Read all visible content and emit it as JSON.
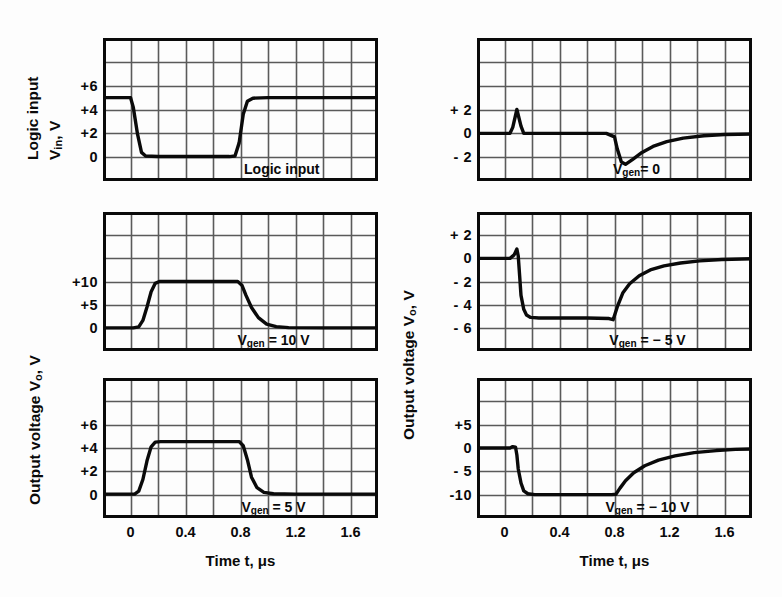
{
  "figure": {
    "background": "#fdfdfd",
    "ink": "#0a0a0a",
    "grid_color": "#5a5a5a"
  },
  "axis_titles": {
    "x_left": "Time t, μs",
    "x_right": "Time t, μs",
    "y_left_top_line1": "Logic input",
    "y_left_top_line2": "V",
    "y_left_top_sub": "in",
    "y_left_top_tail": ", V",
    "y_left_output": "Output voltage V",
    "y_left_output_sub": "o",
    "y_left_output_tail": ", V",
    "y_right_output": "Output voltage V",
    "y_right_output_sub": "o",
    "y_right_output_tail": ", V"
  },
  "x_axis": {
    "ticks": [
      "0",
      "0.4",
      "0.8",
      "1.2",
      "1.6"
    ],
    "tick_values": [
      0,
      0.4,
      0.8,
      1.2,
      1.6
    ],
    "min": -0.2,
    "max": 1.8,
    "unit": "μs",
    "grid_columns": 10
  },
  "panels": [
    {
      "id": "logic-input",
      "column": "left",
      "row": 1,
      "annotation": "Logic input",
      "annotation_x": 0.65,
      "y_ticks": [
        "+6",
        "+4",
        "+2",
        "0"
      ],
      "y_tick_values": [
        6,
        4,
        2,
        0
      ],
      "y_min": -2,
      "y_max": 10,
      "grid_rows": 6,
      "grid_step": 2
    },
    {
      "id": "vgen-10v",
      "column": "left",
      "row": 2,
      "annotation": "V",
      "annotation_sub": "gen",
      "annotation_tail": " = 10 V",
      "annotation_x": 0.62,
      "y_ticks": [
        "+10",
        "+5",
        "0"
      ],
      "y_tick_values": [
        10,
        5,
        0
      ],
      "y_min": -5,
      "y_max": 25,
      "grid_rows": 6,
      "grid_step": 5
    },
    {
      "id": "vgen-5v",
      "column": "left",
      "row": 3,
      "annotation": "V",
      "annotation_sub": "gen",
      "annotation_tail": " = 5 V",
      "annotation_x": 0.62,
      "y_ticks": [
        "+6",
        "+4",
        "+2",
        "0"
      ],
      "y_tick_values": [
        6,
        4,
        2,
        0
      ],
      "y_min": -2,
      "y_max": 10,
      "grid_rows": 6,
      "grid_step": 2
    },
    {
      "id": "vgen-0",
      "column": "right",
      "row": 1,
      "annotation": "V",
      "annotation_sub": "gen",
      "annotation_tail": "= 0",
      "annotation_x": 0.58,
      "y_ticks": [
        "+ 2",
        "0",
        "- 2"
      ],
      "y_tick_values": [
        2,
        0,
        -2
      ],
      "y_min": -4,
      "y_max": 8,
      "grid_rows": 6,
      "grid_step": 2
    },
    {
      "id": "vgen-minus-5v",
      "column": "right",
      "row": 2,
      "annotation": "V",
      "annotation_sub": "gen",
      "annotation_tail": " = − 5 V",
      "annotation_x": 0.62,
      "y_ticks": [
        "+ 2",
        "0",
        "- 2",
        "- 4",
        "- 6"
      ],
      "y_tick_values": [
        2,
        0,
        -2,
        -4,
        -6
      ],
      "y_min": -8,
      "y_max": 4,
      "grid_rows": 6,
      "grid_step": 2
    },
    {
      "id": "vgen-minus-10v",
      "column": "right",
      "row": 3,
      "annotation": "V",
      "annotation_sub": "gen",
      "annotation_tail": " = − 10 V",
      "annotation_x": 0.62,
      "y_ticks": [
        "+5",
        "0",
        "- 5",
        "-10"
      ],
      "y_tick_values": [
        5,
        0,
        -5,
        -10
      ],
      "y_min": -15,
      "y_max": 15,
      "grid_rows": 6,
      "grid_step": 5
    }
  ],
  "chart_data": {
    "type": "line",
    "title": "",
    "xlabel": "Time t, μs",
    "ylabel": "Voltage, V",
    "xlim": [
      -0.2,
      1.8
    ],
    "grid": true,
    "legend": "none",
    "series": [
      {
        "name": "Logic input",
        "panel": "logic-input",
        "ylabel": "Logic input V_in, V",
        "ylim": [
          -2,
          10
        ],
        "points": [
          [
            -0.2,
            5.0
          ],
          [
            -0.02,
            5.0
          ],
          [
            0.0,
            5.0
          ],
          [
            0.02,
            4.2
          ],
          [
            0.05,
            2.0
          ],
          [
            0.08,
            0.4
          ],
          [
            0.11,
            0.1
          ],
          [
            0.2,
            0.05
          ],
          [
            0.5,
            0.05
          ],
          [
            0.72,
            0.05
          ],
          [
            0.76,
            0.1
          ],
          [
            0.79,
            1.2
          ],
          [
            0.82,
            3.6
          ],
          [
            0.85,
            4.7
          ],
          [
            0.89,
            4.95
          ],
          [
            1.0,
            5.0
          ],
          [
            1.4,
            5.0
          ],
          [
            1.8,
            5.0
          ]
        ]
      },
      {
        "name": "Output Vgen = 10 V",
        "panel": "vgen-10v",
        "ylabel": "Output voltage V_o, V",
        "ylim": [
          -5,
          25
        ],
        "points": [
          [
            -0.2,
            0.0
          ],
          [
            0.02,
            0.0
          ],
          [
            0.06,
            0.2
          ],
          [
            0.09,
            1.6
          ],
          [
            0.12,
            4.5
          ],
          [
            0.15,
            7.8
          ],
          [
            0.18,
            9.6
          ],
          [
            0.21,
            10.0
          ],
          [
            0.3,
            10.0
          ],
          [
            0.6,
            10.0
          ],
          [
            0.78,
            10.0
          ],
          [
            0.81,
            9.2
          ],
          [
            0.84,
            7.0
          ],
          [
            0.88,
            4.4
          ],
          [
            0.93,
            2.2
          ],
          [
            0.99,
            0.8
          ],
          [
            1.06,
            0.25
          ],
          [
            1.15,
            0.05
          ],
          [
            1.4,
            0.0
          ],
          [
            1.8,
            0.0
          ]
        ]
      },
      {
        "name": "Output Vgen = 5 V",
        "panel": "vgen-5v",
        "ylabel": "Output voltage V_o, V",
        "ylim": [
          -2,
          10
        ],
        "points": [
          [
            -0.2,
            0.05
          ],
          [
            0.03,
            0.05
          ],
          [
            0.06,
            0.3
          ],
          [
            0.09,
            1.3
          ],
          [
            0.12,
            2.9
          ],
          [
            0.15,
            4.1
          ],
          [
            0.18,
            4.5
          ],
          [
            0.22,
            4.55
          ],
          [
            0.4,
            4.55
          ],
          [
            0.7,
            4.55
          ],
          [
            0.79,
            4.55
          ],
          [
            0.82,
            4.2
          ],
          [
            0.85,
            3.0
          ],
          [
            0.88,
            1.5
          ],
          [
            0.92,
            0.6
          ],
          [
            0.97,
            0.2
          ],
          [
            1.04,
            0.08
          ],
          [
            1.2,
            0.05
          ],
          [
            1.5,
            0.05
          ],
          [
            1.8,
            0.05
          ]
        ]
      },
      {
        "name": "Output Vgen = 0",
        "panel": "vgen-0",
        "ylabel": "Output voltage V_o, V",
        "ylim": [
          -4,
          8
        ],
        "points": [
          [
            -0.2,
            0.0
          ],
          [
            0.04,
            0.0
          ],
          [
            0.06,
            0.5
          ],
          [
            0.09,
            2.0
          ],
          [
            0.12,
            0.6
          ],
          [
            0.14,
            0.0
          ],
          [
            0.3,
            0.0
          ],
          [
            0.6,
            0.0
          ],
          [
            0.74,
            0.0
          ],
          [
            0.77,
            -0.15
          ],
          [
            0.8,
            -0.3
          ],
          [
            0.82,
            -1.3
          ],
          [
            0.85,
            -2.4
          ],
          [
            0.88,
            -2.6
          ],
          [
            0.93,
            -2.2
          ],
          [
            1.0,
            -1.6
          ],
          [
            1.08,
            -1.1
          ],
          [
            1.18,
            -0.7
          ],
          [
            1.3,
            -0.4
          ],
          [
            1.45,
            -0.2
          ],
          [
            1.6,
            -0.1
          ],
          [
            1.8,
            -0.05
          ]
        ]
      },
      {
        "name": "Output Vgen = -5 V",
        "panel": "vgen-minus-5v",
        "ylabel": "Output voltage V_o, V",
        "ylim": [
          -8,
          4
        ],
        "points": [
          [
            -0.2,
            0.0
          ],
          [
            0.04,
            0.0
          ],
          [
            0.07,
            0.3
          ],
          [
            0.09,
            0.8
          ],
          [
            0.1,
            0.2
          ],
          [
            0.11,
            -1.5
          ],
          [
            0.12,
            -3.2
          ],
          [
            0.14,
            -4.4
          ],
          [
            0.16,
            -4.9
          ],
          [
            0.19,
            -5.1
          ],
          [
            0.25,
            -5.15
          ],
          [
            0.4,
            -5.15
          ],
          [
            0.6,
            -5.15
          ],
          [
            0.76,
            -5.2
          ],
          [
            0.79,
            -5.3
          ],
          [
            0.82,
            -4.2
          ],
          [
            0.86,
            -3.0
          ],
          [
            0.91,
            -2.2
          ],
          [
            0.98,
            -1.5
          ],
          [
            1.06,
            -1.0
          ],
          [
            1.16,
            -0.65
          ],
          [
            1.28,
            -0.4
          ],
          [
            1.42,
            -0.22
          ],
          [
            1.58,
            -0.1
          ],
          [
            1.8,
            -0.03
          ]
        ]
      },
      {
        "name": "Output Vgen = -10 V",
        "panel": "vgen-minus-10v",
        "ylabel": "Output voltage V_o, V",
        "ylim": [
          -15,
          15
        ],
        "points": [
          [
            -0.2,
            0.0
          ],
          [
            0.04,
            0.0
          ],
          [
            0.06,
            0.3
          ],
          [
            0.08,
            0.2
          ],
          [
            0.09,
            -1.5
          ],
          [
            0.1,
            -4.5
          ],
          [
            0.12,
            -7.5
          ],
          [
            0.14,
            -9.2
          ],
          [
            0.17,
            -9.8
          ],
          [
            0.22,
            -10.0
          ],
          [
            0.35,
            -10.0
          ],
          [
            0.6,
            -10.0
          ],
          [
            0.78,
            -10.0
          ],
          [
            0.81,
            -9.9
          ],
          [
            0.84,
            -8.6
          ],
          [
            0.88,
            -7.0
          ],
          [
            0.94,
            -5.3
          ],
          [
            1.02,
            -3.8
          ],
          [
            1.12,
            -2.6
          ],
          [
            1.24,
            -1.7
          ],
          [
            1.38,
            -1.0
          ],
          [
            1.54,
            -0.55
          ],
          [
            1.68,
            -0.3
          ],
          [
            1.8,
            -0.2
          ]
        ]
      }
    ]
  }
}
